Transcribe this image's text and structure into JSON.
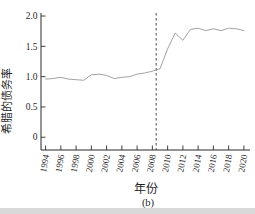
{
  "figure": {
    "caption": "(b)",
    "background": "#ffffff"
  },
  "chart_data": {
    "type": "line",
    "title": "",
    "xlabel": "年份",
    "ylabel": "希腊的债务率",
    "x": [
      1994,
      1995,
      1996,
      1997,
      1998,
      1999,
      2000,
      2001,
      2002,
      2003,
      2004,
      2005,
      2006,
      2007,
      2008,
      2009,
      2010,
      2011,
      2012,
      2013,
      2014,
      2015,
      2016,
      2017,
      2018,
      2019,
      2020
    ],
    "series": [
      {
        "name": "希腊的债务率",
        "values": [
          0.96,
          0.97,
          0.99,
          0.96,
          0.95,
          0.94,
          1.03,
          1.04,
          1.02,
          0.97,
          0.99,
          1.0,
          1.04,
          1.06,
          1.09,
          1.13,
          1.46,
          1.72,
          1.6,
          1.78,
          1.8,
          1.76,
          1.79,
          1.76,
          1.8,
          1.79,
          1.76
        ]
      }
    ],
    "xticks": [
      1994,
      1996,
      1998,
      2000,
      2002,
      2004,
      2006,
      2008,
      2010,
      2012,
      2014,
      2016,
      2018,
      2020
    ],
    "xtick_labels": [
      "1994",
      "1996",
      "1998",
      "2000",
      "2002",
      "2004",
      "2006",
      "2008",
      "2010",
      "2012",
      "2014",
      "2016",
      "2018",
      "2020"
    ],
    "yticks": [
      0,
      0.5,
      1,
      1.5,
      2
    ],
    "ytick_labels": [
      "0",
      "0.5",
      "1.0",
      "1.5",
      "2.0"
    ],
    "xlim": [
      1993.4,
      2020.8
    ],
    "ylim": [
      -0.21,
      2.05
    ],
    "grid": false,
    "legend": "none",
    "vline": {
      "x": 2008.5,
      "style": "dashed"
    },
    "colors": {
      "line": "#8a8a8a",
      "axis": "#2b2b2b",
      "vline": "#3a3a3a",
      "text": "#1f1f1f",
      "scan_edge": "#d9d9d9"
    }
  }
}
